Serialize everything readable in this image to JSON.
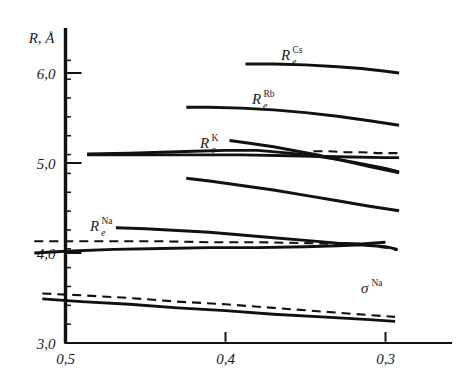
{
  "figure": {
    "background": "#ffffff",
    "ink": "#111111",
    "axis_color": "#111111"
  },
  "axes": {
    "y_title": "R, Å",
    "y_ticks": [
      {
        "value": 3.0,
        "label": "3,0"
      },
      {
        "value": 4.0,
        "label": "4,0"
      },
      {
        "value": 5.0,
        "label": "5,0"
      },
      {
        "value": 6.0,
        "label": "6,0"
      }
    ],
    "y_minor_count": 15,
    "x_ticks": [
      {
        "value": 0.5,
        "label": "0,5"
      },
      {
        "value": 0.4,
        "label": "0,4"
      },
      {
        "value": 0.3,
        "label": "0,3"
      }
    ],
    "xlim": [
      0.52,
      0.285
    ],
    "ylim": [
      3.0,
      6.35
    ],
    "x_direction": "decreasing",
    "grid": false
  },
  "annotations": [
    {
      "name": "label-Re-Cs",
      "base": "R",
      "sub": "e",
      "sup": "Cs",
      "x_px": 281,
      "y_px": 60
    },
    {
      "name": "label-Re-Rb",
      "base": "R",
      "sub": "e",
      "sup": "Rb",
      "x_px": 252,
      "y_px": 104
    },
    {
      "name": "label-Re-K",
      "base": "R",
      "sub": "e",
      "sup": "K",
      "x_px": 200,
      "y_px": 148
    },
    {
      "name": "label-Re-Na",
      "base": "R",
      "sub": "e",
      "sup": "Na",
      "x_px": 90,
      "y_px": 231
    },
    {
      "name": "label-sigma-Na",
      "base": "σ",
      "sub": "",
      "sup": "Na",
      "x_px": 361,
      "y_px": 293
    }
  ],
  "chart_data": {
    "type": "line",
    "title": "",
    "xlabel": "",
    "ylabel": "R, Å",
    "xlim": [
      0.52,
      0.285
    ],
    "ylim": [
      3.0,
      6.35
    ],
    "xticks": [
      0.5,
      0.4,
      0.3
    ],
    "yticks": [
      3.0,
      4.0,
      5.0,
      6.0
    ],
    "grid": false,
    "legend": "inline-labels",
    "series": [
      {
        "name": "R_e^Cs",
        "style": "solid",
        "label": "R_e^Cs",
        "x": [
          0.3875,
          0.37,
          0.35,
          0.33,
          0.315,
          0.3,
          0.2915
        ],
        "y": [
          6.1,
          6.1,
          6.09,
          6.07,
          6.05,
          6.02,
          6.0
        ]
      },
      {
        "name": "R_e^Rb",
        "style": "solid",
        "label": "R_e^Rb",
        "x": [
          0.4245,
          0.41,
          0.39,
          0.37,
          0.35,
          0.33,
          0.31,
          0.2915
        ],
        "y": [
          5.62,
          5.62,
          5.61,
          5.59,
          5.56,
          5.52,
          5.47,
          5.42
        ]
      },
      {
        "name": "R_e^K-upper",
        "style": "solid",
        "label": "R_e^K",
        "x": [
          0.3975,
          0.385,
          0.37,
          0.355,
          0.34,
          0.325,
          0.31,
          0.2915
        ],
        "y": [
          5.25,
          5.22,
          5.18,
          5.13,
          5.08,
          5.02,
          4.96,
          4.89
        ]
      },
      {
        "name": "R_e^K-main",
        "style": "solid",
        "label": "",
        "x": [
          0.4865,
          0.46,
          0.44,
          0.42,
          0.4,
          0.38,
          0.36,
          0.34,
          0.32,
          0.3,
          0.2915
        ],
        "y": [
          5.1,
          5.11,
          5.12,
          5.13,
          5.14,
          5.14,
          5.11,
          5.07,
          5.01,
          4.94,
          4.9
        ]
      },
      {
        "name": "R_e^K-flat",
        "style": "solid",
        "label": "",
        "x": [
          0.4865,
          0.45,
          0.42,
          0.39,
          0.36,
          0.33,
          0.3,
          0.2915
        ],
        "y": [
          5.09,
          5.09,
          5.09,
          5.09,
          5.08,
          5.07,
          5.06,
          5.06
        ]
      },
      {
        "name": "R_e^K-dashed",
        "style": "dashed",
        "label": "",
        "x": [
          0.345,
          0.335,
          0.325,
          0.315,
          0.305,
          0.2915
        ],
        "y": [
          5.13,
          5.13,
          5.12,
          5.12,
          5.11,
          5.11
        ]
      },
      {
        "name": "mid-curve",
        "style": "solid",
        "label": "",
        "x": [
          0.4245,
          0.41,
          0.39,
          0.37,
          0.35,
          0.33,
          0.31,
          0.2915
        ],
        "y": [
          4.83,
          4.8,
          4.75,
          4.7,
          4.64,
          4.58,
          4.52,
          4.47
        ]
      },
      {
        "name": "Na-rising",
        "style": "solid",
        "label": "",
        "x": [
          0.4685,
          0.45,
          0.43,
          0.41,
          0.39,
          0.37,
          0.35,
          0.33,
          0.315,
          0.3
        ],
        "y": [
          4.28,
          4.27,
          4.25,
          4.23,
          4.2,
          4.17,
          4.14,
          4.11,
          4.1,
          4.12
        ]
      },
      {
        "name": "R_e^Na-solid",
        "style": "solid",
        "label": "R_e^Na",
        "x": [
          0.5195,
          0.5,
          0.47,
          0.44,
          0.41,
          0.38,
          0.35,
          0.33,
          0.315,
          0.3,
          0.2925
        ],
        "y": [
          4.0,
          4.02,
          4.04,
          4.05,
          4.06,
          4.06,
          4.07,
          4.08,
          4.09,
          4.07,
          4.04
        ]
      },
      {
        "name": "R_e^Na-dashed",
        "style": "dashed",
        "label": "",
        "x": [
          0.5195,
          0.5,
          0.47,
          0.44,
          0.41,
          0.38,
          0.35,
          0.33,
          0.315,
          0.3,
          0.2925
        ],
        "y": [
          4.13,
          4.13,
          4.13,
          4.13,
          4.12,
          4.12,
          4.11,
          4.1,
          4.09,
          4.06,
          4.03
        ]
      },
      {
        "name": "sigma-Na-solid",
        "style": "solid",
        "label": "σ^Na",
        "x": [
          0.5145,
          0.49,
          0.46,
          0.43,
          0.4,
          0.37,
          0.34,
          0.31,
          0.294
        ],
        "y": [
          3.49,
          3.46,
          3.43,
          3.39,
          3.36,
          3.32,
          3.29,
          3.26,
          3.24
        ]
      },
      {
        "name": "sigma-Na-dashed",
        "style": "dashed",
        "label": "",
        "x": [
          0.5145,
          0.49,
          0.46,
          0.43,
          0.4,
          0.37,
          0.34,
          0.31,
          0.294
        ],
        "y": [
          3.55,
          3.53,
          3.5,
          3.46,
          3.43,
          3.39,
          3.35,
          3.31,
          3.29
        ]
      }
    ]
  }
}
